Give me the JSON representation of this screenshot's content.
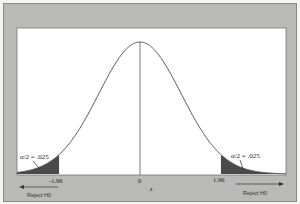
{
  "chart_data": {
    "type": "area",
    "title": "",
    "xlabel": "z",
    "ylabel": "",
    "xlim": [
      -3.0,
      3.5
    ],
    "mean": 0,
    "sd": 1,
    "x_ticks": [
      {
        "value": -1.96,
        "label": "-1.96"
      },
      {
        "value": 0,
        "label": "0"
      },
      {
        "value": 1.96,
        "label": "1.96"
      }
    ],
    "critical_values": [
      -1.96,
      1.96
    ],
    "shaded_regions": [
      {
        "from": "-inf",
        "to": -1.96,
        "area": 0.025,
        "label": "α/2 = .025"
      },
      {
        "from": 1.96,
        "to": "inf",
        "area": 0.025,
        "label": "α/2 = .025"
      }
    ],
    "annotations": [
      {
        "text": "α/2 = .025",
        "side": "left"
      },
      {
        "text": "α/2 = .025",
        "side": "right"
      },
      {
        "text": "Reject H0",
        "side": "left",
        "arrow": "left"
      },
      {
        "text": "Reject H0",
        "side": "right",
        "arrow": "right"
      }
    ],
    "center_line": 0,
    "grid": false,
    "legend": false
  },
  "labels": {
    "tick_neg": "-1.96",
    "tick_zero": "0",
    "tick_pos": "1.96",
    "axis_z": "z",
    "alpha_left": "α/2 = .025",
    "alpha_right": "α/2 = .025",
    "reject_left": "Reject H0",
    "reject_right": "Reject H0"
  },
  "colors": {
    "frame": "#b9b9b7",
    "plot_bg": "#ffffff",
    "curve": "#555555",
    "tail_fill": "#4a4a4a"
  }
}
